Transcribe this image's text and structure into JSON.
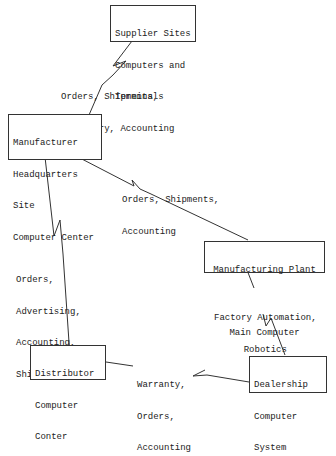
{
  "nodes": {
    "supplier": {
      "lines": [
        "Supplier Sites",
        "Computers and",
        "Terminals"
      ]
    },
    "headquarters": {
      "lines": [
        "Manufacturer",
        "Headquarters",
        "Site",
        "Computer Center"
      ]
    },
    "plant": {
      "lines": [
        "Manufacturing Plant",
        "",
        "Main Computer"
      ]
    },
    "distributor": {
      "lines": [
        "Distributor",
        "Computer",
        "Conter"
      ]
    },
    "dealership": {
      "lines": [
        "Dealership",
        "Computer",
        "System"
      ]
    }
  },
  "links": {
    "supplier_hq": {
      "lines": [
        "Orders, Shipments,",
        "Inventory, Accounting"
      ]
    },
    "hq_plant": {
      "lines": [
        "Orders, Shipments,",
        "Accounting"
      ]
    },
    "hq_distributor": {
      "lines": [
        "Orders,",
        "Advertising,",
        "Accounting,",
        "Shipments"
      ]
    },
    "plant_dealership": {
      "lines": [
        "Factory Automation,",
        "Robotics"
      ]
    },
    "distributor_dealership": {
      "lines": [
        "Warranty,",
        "Orders,",
        "Accounting"
      ]
    }
  },
  "colors": {
    "line": "#333333",
    "text": "#222222",
    "background": "#ffffff"
  }
}
